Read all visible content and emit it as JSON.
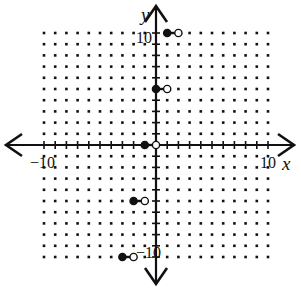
{
  "chart_data": {
    "type": "scatter",
    "title": "",
    "xlabel": "x",
    "ylabel": "y",
    "xlim": [
      -10,
      10
    ],
    "ylim": [
      -10,
      10
    ],
    "grid": "dots",
    "tick_labels": {
      "x": [
        "-10",
        "10"
      ],
      "y": [
        "10",
        "-10"
      ]
    },
    "segments": [
      {
        "x_start": 1,
        "x_end": 2,
        "y": 10,
        "start": "closed",
        "end": "open"
      },
      {
        "x_start": 0,
        "x_end": 1,
        "y": 5,
        "start": "closed",
        "end": "open"
      },
      {
        "x_start": -1,
        "x_end": 0,
        "y": 0,
        "start": "closed",
        "end": "open"
      },
      {
        "x_start": -2,
        "x_end": -1,
        "y": -5,
        "start": "closed",
        "end": "open"
      },
      {
        "x_start": -3,
        "x_end": -2,
        "y": -10,
        "start": "closed",
        "end": "open"
      }
    ]
  },
  "labels": {
    "x_axis": "x",
    "y_axis": "y",
    "x_min": "−10",
    "x_max": "10",
    "y_max": "10",
    "y_min": "−10"
  },
  "colors": {
    "ink": "#111111",
    "background": "#ffffff"
  }
}
